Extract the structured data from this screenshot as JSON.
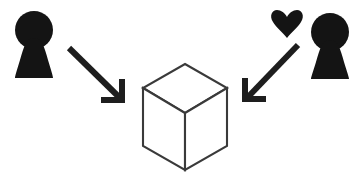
{
  "canvas": {
    "width": 358,
    "height": 184,
    "background_color": "#ffffff",
    "title": "Two observers directing attention at a cube"
  },
  "palette": {
    "ink": "#141414",
    "figure_fill": "#141414",
    "arrow_stroke": "#1e1e1e",
    "cube_stroke": "#3a3a3a",
    "cube_fill": "#ffffff",
    "background": "#ffffff"
  },
  "elements": {
    "left_person": {
      "semantic_name": "person-icon",
      "label": "Person (left observer)",
      "fill": "#141414",
      "head": {
        "cx": 34,
        "cy": 30,
        "r": 19
      },
      "body_path": "M 34 38 C 26 38 24 46 20 60 C 17 70 15 76 15 78 L 53 78 C 53 76 51 70 48 60 C 44 46 42 38 34 38 Z",
      "bbox": {
        "x": 14,
        "y": 11,
        "width": 40,
        "height": 67
      }
    },
    "right_person": {
      "semantic_name": "person-icon",
      "label": "Person (right observer)",
      "fill": "#141414",
      "head": {
        "cx": 330,
        "cy": 32,
        "r": 19
      },
      "body_path": "M 330 40 C 322 40 320 48 316 62 C 313 72 311 77 311 79 L 349 79 C 349 77 347 72 344 62 C 340 48 338 40 330 40 Z",
      "bbox": {
        "x": 310,
        "y": 13,
        "width": 40,
        "height": 66
      }
    },
    "heart": {
      "semantic_name": "heart-icon",
      "label": "Heart (affective attention marker)",
      "fill": "#141414",
      "path": "M 287 38 C 283 33 276 27 273 22 C 269 16 272 10 277 10 C 281 10 285 13 287 17 C 289 13 293 10 297 10 C 302 10 305 16 301 22 C 298 27 291 33 287 38 Z",
      "bbox": {
        "x": 272,
        "y": 10,
        "width": 30,
        "height": 28
      }
    },
    "left_arrow": {
      "semantic_name": "arrow-down-right-icon",
      "label": "Arrow from left person to cube",
      "stroke": "#1e1e1e",
      "stroke_width": 6,
      "shaft": {
        "x1": 69,
        "y1": 48,
        "x2": 121,
        "y2": 99
      },
      "head_path": "M 122 79 L 122 100 L 101 100",
      "direction": "down-right",
      "head_style": "right-angle-bracket"
    },
    "right_arrow": {
      "semantic_name": "arrow-down-left-icon",
      "label": "Arrow from right person to cube",
      "stroke": "#1e1e1e",
      "stroke_width": 6,
      "shaft": {
        "x1": 298,
        "y1": 45,
        "x2": 247,
        "y2": 98
      },
      "head_path": "M 245 78 L 245 99 L 266 99",
      "direction": "down-left",
      "head_style": "right-angle-bracket"
    },
    "cube": {
      "semantic_name": "cube-object",
      "label": "Isometric wireframe cube (shared object of attention)",
      "stroke": "#3a3a3a",
      "stroke_width": 2.1,
      "fill": "#ffffff",
      "vertices": {
        "top": {
          "x": 185,
          "y": 64
        },
        "left_upper": {
          "x": 143,
          "y": 88
        },
        "right_upper": {
          "x": 227,
          "y": 88
        },
        "center": {
          "x": 185,
          "y": 113
        },
        "left_lower": {
          "x": 143,
          "y": 146
        },
        "right_lower": {
          "x": 227,
          "y": 146
        },
        "bottom": {
          "x": 185,
          "y": 170
        }
      },
      "faces": {
        "top_face": "M 185 64 L 227 88 L 185 113 L 143 88 Z",
        "left_face": "M 143 88 L 185 113 L 185 170 L 143 146 Z",
        "right_face": "M 227 88 L 227 146 L 185 170 L 185 113 Z"
      },
      "bbox": {
        "x": 143,
        "y": 64,
        "width": 84,
        "height": 106
      }
    }
  }
}
